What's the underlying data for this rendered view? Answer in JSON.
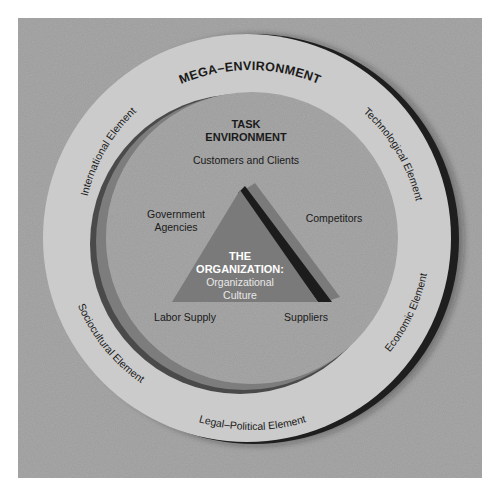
{
  "mega": {
    "title": "MEGA–ENVIRONMENT",
    "elements": {
      "international": "International Element",
      "technological": "Technological Element",
      "economic": "Economic Element",
      "legal_political": "Legal–Political Element",
      "sociocultural": "Sociocultural Element"
    }
  },
  "task": {
    "title_line1": "TASK",
    "title_line2": "ENVIRONMENT",
    "items": {
      "customers": "Customers and Clients",
      "government_line1": "Government",
      "government_line2": "Agencies",
      "competitors": "Competitors",
      "labor": "Labor Supply",
      "suppliers": "Suppliers"
    }
  },
  "organization": {
    "line1": "THE",
    "line2": "ORGANIZATION:",
    "line3": "Organizational",
    "line4": "Culture"
  },
  "colors": {
    "background": "#a9a9a9",
    "ring": "#cbcbcb",
    "ring_shadow": "#1e1e1e",
    "triangle": "#7a7a7a",
    "triangle_edge": "#1c1c1c",
    "org_title": "#ffffff",
    "org_subtitle": "#e8e8e8"
  }
}
